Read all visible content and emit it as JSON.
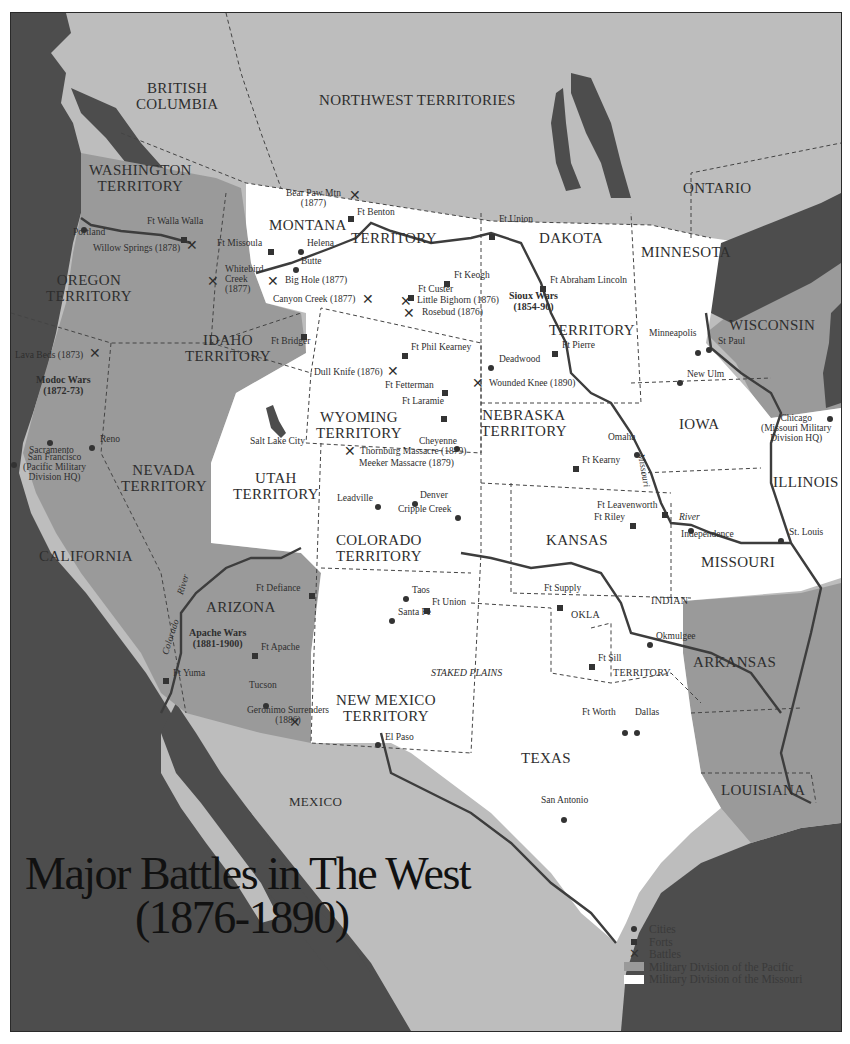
{
  "title": {
    "line1": "Major Battles in The West",
    "line2": "(1876-1890)"
  },
  "colors": {
    "ocean": "#4d4d4d",
    "foreign_land": "#bdbdbd",
    "pacific_division": "#9a9a9a",
    "missouri_division": "#ffffff",
    "border_dashed": "#444444",
    "river": "#3d3d3d",
    "text": "#2e2e2e"
  },
  "regions": {
    "british_columbia": "BRITISH\nCOLUMBIA",
    "northwest_territories": "NORTHWEST TERRITORIES",
    "ontario": "ONTARIO",
    "washington": "WASHINGTON\nTERRITORY",
    "oregon": "OREGON\nTERRITORY",
    "idaho": "IDAHO\nTERRITORY",
    "montana_1": "MONTANA",
    "montana_2": "TERRITORY",
    "dakota_1": "DAKOTA",
    "dakota_2": "TERRITORY",
    "minnesota": "MINNESOTA",
    "wisconsin": "WISCONSIN",
    "wyoming": "WYOMING\nTERRITORY",
    "nebraska": "NEBRASKA\nTERRITORY",
    "iowa": "IOWA",
    "illinois": "ILLINOIS",
    "nevada": "NEVADA\nTERRITORY",
    "utah": "UTAH\nTERRITORY",
    "california": "CALIFORNIA",
    "colorado": "COLORADO\nTERRITORY",
    "kansas": "KANSAS",
    "missouri": "MISSOURI",
    "arizona": "ARIZONA",
    "new_mexico": "NEW MEXICO\nTERRITORY",
    "indian": "INDIAN",
    "okla": "OKLA",
    "territory_indian": "TERRITORY",
    "arkansas": "ARKANSAS",
    "texas": "TEXAS",
    "louisiana": "LOUISIANA",
    "mexico": "MEXICO",
    "staked_plains": "STAKED PLAINS",
    "missouri_river": "Missouri",
    "river": "River",
    "colorado_river": "Colorado",
    "river_az": "River"
  },
  "wars": {
    "modoc": "Modoc Wars\n(1872-73)",
    "sioux": "Sioux Wars\n(1854-90)",
    "apache": "Apache Wars\n(1881-1900)"
  },
  "cities": [
    {
      "name": "Portland",
      "x": 83,
      "y": 222
    },
    {
      "name": "Helena",
      "x": 300,
      "y": 240
    },
    {
      "name": "Butte",
      "x": 294,
      "y": 258
    },
    {
      "name": "Deadwood",
      "x": 490,
      "y": 359
    },
    {
      "name": "Minneapolis",
      "x": 697,
      "y": 344
    },
    {
      "name": "St Paul",
      "x": 708,
      "y": 342
    },
    {
      "name": "New Ulm",
      "x": 679,
      "y": 374
    },
    {
      "name": "Chicago\n(Missouri Military\nDivision HQ)",
      "x": 829,
      "y": 413
    },
    {
      "name": "Sacramento",
      "x": 50,
      "y": 435
    },
    {
      "name": "Reno",
      "x": 91,
      "y": 440
    },
    {
      "name": "San Francisco\n(Pacific Military\nDivision HQ)",
      "x": 15,
      "y": 458
    },
    {
      "name": "Salt Lake City",
      "x": 0,
      "y": 0
    },
    {
      "name": "Cheyenne",
      "x": 455,
      "y": 440
    },
    {
      "name": "Omaha",
      "x": 636,
      "y": 447
    },
    {
      "name": "Leadville",
      "x": 377,
      "y": 498
    },
    {
      "name": "Denver",
      "x": 414,
      "y": 495
    },
    {
      "name": "Cripple Creek",
      "x": 457,
      "y": 509
    },
    {
      "name": "Independence",
      "x": 690,
      "y": 522
    },
    {
      "name": "St. Louis",
      "x": 780,
      "y": 533
    },
    {
      "name": "Taos",
      "x": 405,
      "y": 590
    },
    {
      "name": "Santa Fe",
      "x": 391,
      "y": 612
    },
    {
      "name": "Okmulgee",
      "x": 649,
      "y": 636
    },
    {
      "name": "Tucson",
      "x": 265,
      "y": 697
    },
    {
      "name": "El Paso",
      "x": 377,
      "y": 735
    },
    {
      "name": "Ft Worth",
      "x": 624,
      "y": 724
    },
    {
      "name": "Dallas",
      "x": 636,
      "y": 724
    },
    {
      "name": "San Antonio",
      "x": 563,
      "y": 812
    }
  ],
  "forts": [
    "Ft Benton",
    "Ft Walla Walla",
    "Ft Missoula",
    "Ft Union (Dakota)",
    "Ft Keogh",
    "Ft Custer",
    "Ft Abraham Lincoln",
    "Ft Bridger",
    "Ft Phil Kearney",
    "Ft Fetterman",
    "Ft Laramie",
    "Ft Pierre",
    "Ft Kearny",
    "Ft Leavenworth",
    "Ft Riley",
    "Ft Defiance",
    "Ft Union (New Mexico)",
    "Ft Supply",
    "Ft Sill",
    "Ft Apache",
    "Ft Yuma"
  ],
  "labels": {
    "bear_paw": "Bear Paw Mtn\n(1877)",
    "ft_benton": "Ft Benton",
    "ft_walla_walla": "Ft Walla Walla",
    "portland": "Portland",
    "willow_springs": "Willow Springs (1878)",
    "ft_missoula": "Ft Missoula",
    "helena": "Helena",
    "butte": "Butte",
    "whitebird": "Whitebird\nCreek\n(1877)",
    "big_hole": "Big Hole (1877)",
    "canyon_creek": "Canyon Creek (1877)",
    "ft_union_d": "Ft Union",
    "ft_keogh": "Ft Keogh",
    "ft_custer": "Ft Custer",
    "little_bighorn": "Little Bighorn (1876)",
    "rosebud": "Rosebud (1876)",
    "ft_abraham_lincoln": "Ft Abraham Lincoln",
    "ft_bridger": "Ft Bridger",
    "lava_beds": "Lava Beds (1873)",
    "ft_phil_kearney": "Ft Phil Kearney",
    "dull_knife": "Dull Knife (1876)",
    "ft_fetterman": "Ft Fetterman",
    "ft_laramie": "Ft Laramie",
    "deadwood": "Deadwood",
    "ft_pierre": "Ft Pierre",
    "wounded_knee": "Wounded Knee (1890)",
    "minneapolis": "Minneapolis",
    "st_paul": "St Paul",
    "new_ulm": "New Ulm",
    "chicago": "Chicago\n(Missouri Military\nDivision HQ)",
    "sacramento": "Sacramento",
    "reno": "Reno",
    "san_francisco": "San Francisco\n(Pacific Military\nDivision HQ)",
    "salt_lake_city": "Salt Lake City",
    "cheyenne": "Cheyenne",
    "thornburg": "Thornburg Massacre (1879)",
    "meeker": "Meeker Massacre (1879)",
    "omaha": "Omaha",
    "ft_kearny": "Ft Kearny",
    "leadville": "Leadville",
    "denver": "Denver",
    "cripple_creek": "Cripple Creek",
    "ft_leavenworth": "Ft Leavenworth",
    "ft_riley": "Ft Riley",
    "independence": "Independence",
    "st_louis": "St. Louis",
    "ft_defiance": "Ft Defiance",
    "taos": "Taos",
    "ft_union_nm": "Ft Union",
    "santa_fe": "Santa Fe",
    "ft_supply": "Ft Supply",
    "okmulgee": "Okmulgee",
    "ft_sill": "Ft Sill",
    "ft_apache": "Ft Apache",
    "ft_yuma": "Ft Yuma",
    "tucson": "Tucson",
    "geronimo": "Geronimo Surrenders\n(1886)",
    "el_paso": "El Paso",
    "ft_worth": "Ft Worth",
    "dallas": "Dallas",
    "san_antonio": "San Antonio"
  },
  "legend": {
    "cities": "Cities",
    "forts": "Forts",
    "battles": "Battles",
    "pacific": "Military Division of the Pacific",
    "missouri": "Military Division of the Missouri"
  }
}
